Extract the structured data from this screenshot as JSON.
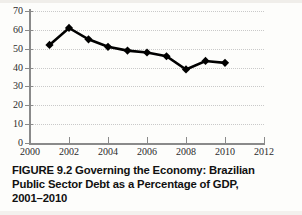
{
  "chart_data": {
    "type": "line",
    "title": "",
    "xlabel": "",
    "ylabel": "",
    "x": [
      2001,
      2002,
      2003,
      2004,
      2005,
      2006,
      2007,
      2008,
      2009,
      2010
    ],
    "values": [
      52,
      61,
      55,
      51,
      49,
      48,
      46,
      39,
      43.5,
      42.5
    ],
    "series": [
      {
        "name": "Brazilian Public Sector Debt (% of GDP)",
        "values": [
          52,
          61,
          55,
          51,
          49,
          48,
          46,
          39,
          43.5,
          42.5
        ]
      }
    ],
    "xlim": [
      2000,
      2012
    ],
    "ylim": [
      0,
      70
    ],
    "xticks": [
      2000,
      2002,
      2004,
      2006,
      2008,
      2010,
      2012
    ],
    "xtick_labels": [
      "2000",
      "2002",
      "2004",
      "2006",
      "2008",
      "2010",
      "2012"
    ],
    "yticks": [
      0,
      10,
      20,
      30,
      40,
      50,
      60,
      70
    ],
    "ytick_labels": [
      "0",
      "10",
      "20",
      "30",
      "40",
      "50",
      "60",
      "70"
    ],
    "grid": "horizontal-dotted",
    "legend": "none",
    "marker": "diamond",
    "line_color": "#000000",
    "marker_color": "#000000",
    "grid_color": "#c9c9c9",
    "axis_color": "#8a8a8a"
  },
  "caption": {
    "line1": "FIGURE 9.2  Governing the Economy: Brazilian",
    "line2": "Public Sector Debt as a Percentage of GDP,",
    "line3": "2001–2010",
    "full": "FIGURE 9.2 Governing the Economy: Brazilian Public Sector Debt as a Percentage of GDP, 2001–2010"
  }
}
